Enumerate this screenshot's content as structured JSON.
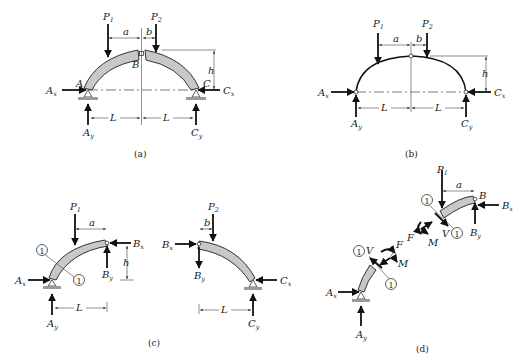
{
  "figure": {
    "panels": [
      {
        "id": "a",
        "caption": "(a)",
        "description": "Three-hinged arch, two curved segments with hinge B at crown",
        "labels": {
          "P1": "P",
          "P1_sub": "1",
          "P2": "P",
          "P2_sub": "2",
          "a": "a",
          "b": "b",
          "h": "h",
          "L_left": "L",
          "L_right": "L",
          "A": "A",
          "B": "B",
          "C": "C",
          "Ax": "A",
          "Ax_sub": "x",
          "Ay": "A",
          "Ay_sub": "y",
          "Cx": "C",
          "Cx_sub": "x",
          "Cy": "C",
          "Cy_sub": "y"
        }
      },
      {
        "id": "b",
        "caption": "(b)",
        "description": "Idealized line model of three-hinged arch",
        "labels": {
          "P1": "P",
          "P1_sub": "1",
          "P2": "P",
          "P2_sub": "2",
          "a": "a",
          "b": "b",
          "h": "h",
          "L_left": "L",
          "L_right": "L",
          "Ax": "A",
          "Ax_sub": "x",
          "Ay": "A",
          "Ay_sub": "y",
          "Cx": "C",
          "Cx_sub": "x",
          "Cy": "C",
          "Cy_sub": "y"
        }
      },
      {
        "id": "c",
        "caption": "(c)",
        "description": "Free-body diagrams of segments AB and BC",
        "labels": {
          "P1": "P",
          "P1_sub": "1",
          "P2": "P",
          "P2_sub": "2",
          "a": "a",
          "b": "b",
          "h": "h",
          "L_left": "L",
          "L_right": "L",
          "section": "1",
          "Ax": "A",
          "Ax_sub": "x",
          "Ay": "A",
          "Ay_sub": "y",
          "Bx": "B",
          "Bx_sub": "x",
          "By": "B",
          "By_sub": "y",
          "Bx2": "B",
          "Bx2_sub": "x",
          "By2": "B",
          "By2_sub": "y",
          "Cx": "C",
          "Cx_sub": "x",
          "Cy": "C",
          "Cy_sub": "y"
        }
      },
      {
        "id": "d",
        "caption": "(d)",
        "description": "Segment AB cut at section 1-1 showing internal forces",
        "labels": {
          "P1": "P",
          "P1_sub": "1",
          "a": "a",
          "B": "B",
          "section": "1",
          "F": "F",
          "V": "V",
          "M": "M",
          "Ax": "A",
          "Ax_sub": "x",
          "Ay": "A",
          "Ay_sub": "y",
          "Bx": "B",
          "Bx_sub": "x",
          "By": "B",
          "By_sub": "y"
        }
      }
    ]
  }
}
